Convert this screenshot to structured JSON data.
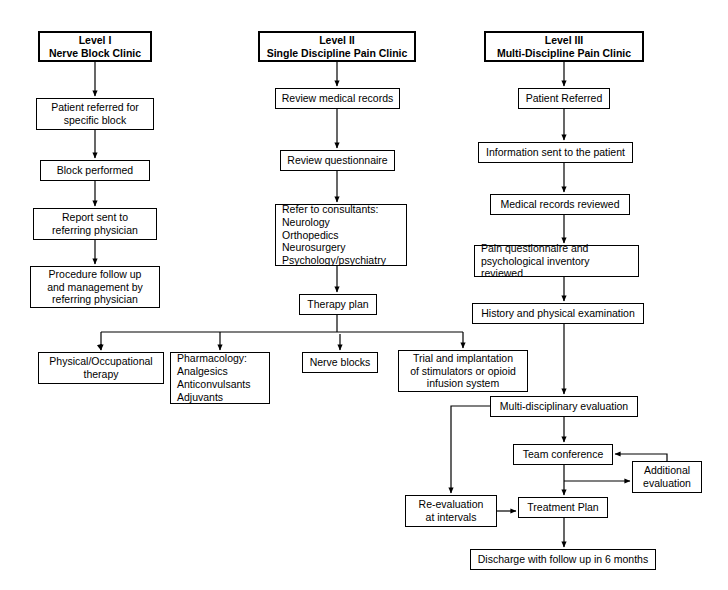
{
  "diagram": {
    "type": "flowchart",
    "background": "#ffffff",
    "line_color": "#000000",
    "text_color": "#000000"
  },
  "columns": [
    {
      "id": "level1",
      "header": "Level I\nNerve Block Clinic"
    },
    {
      "id": "level2",
      "header": "Level II\nSingle Discipline Pain Clinic"
    },
    {
      "id": "level3",
      "header": "Level III\nMulti-Discipline Pain Clinic"
    }
  ],
  "nodes": {
    "l1_header": {
      "text": "Level I\nNerve Block Clinic",
      "x": 38,
      "y": 31,
      "w": 114,
      "h": 31,
      "header": true
    },
    "l1_referred": {
      "text": "Patient referred for\nspecific block",
      "x": 36,
      "y": 98,
      "w": 118,
      "h": 32
    },
    "l1_block": {
      "text": "Block performed",
      "x": 40,
      "y": 160,
      "w": 110,
      "h": 21
    },
    "l1_report": {
      "text": "Report sent to\nreferring physician",
      "x": 33,
      "y": 208,
      "w": 124,
      "h": 32
    },
    "l1_followup": {
      "text": "Procedure follow up\nand management by\nreferring physician",
      "x": 30,
      "y": 266,
      "w": 130,
      "h": 42
    },
    "l2_header": {
      "text": "Level II\nSingle Discipline Pain Clinic",
      "x": 258,
      "y": 31,
      "w": 158,
      "h": 31,
      "header": true
    },
    "l2_records": {
      "text": "Review medical records",
      "x": 275,
      "y": 88,
      "w": 125,
      "h": 21
    },
    "l2_quest": {
      "text": "Review questionnaire",
      "x": 280,
      "y": 150,
      "w": 115,
      "h": 21
    },
    "l2_refer": {
      "text": "Refer to consultants:\n   Neurology\n   Orthopedics\n   Neurosurgery\n   Psychology/psychiatry",
      "x": 275,
      "y": 204,
      "w": 132,
      "h": 62,
      "leftalign": true
    },
    "l2_therapy": {
      "text": "Therapy plan",
      "x": 299,
      "y": 294,
      "w": 78,
      "h": 21
    },
    "b_physical": {
      "text": "Physical/Occupational\ntherapy",
      "x": 38,
      "y": 352,
      "w": 126,
      "h": 32
    },
    "b_pharma": {
      "text": "Pharmacology:\n   Analgesics\n   Anticonvulsants\n   Adjuvants",
      "x": 170,
      "y": 352,
      "w": 100,
      "h": 52,
      "leftalign": true
    },
    "b_nerve": {
      "text": "Nerve blocks",
      "x": 302,
      "y": 352,
      "w": 76,
      "h": 21
    },
    "b_trial": {
      "text": "Trial and implantation\nof stimulators or opioid\ninfusion system",
      "x": 398,
      "y": 350,
      "w": 130,
      "h": 42
    },
    "l3_header": {
      "text": "Level III\nMulti-Discipline Pain Clinic",
      "x": 484,
      "y": 31,
      "w": 160,
      "h": 31,
      "header": true
    },
    "l3_referred": {
      "text": "Patient Referred",
      "x": 518,
      "y": 88,
      "w": 92,
      "h": 21
    },
    "l3_info": {
      "text": "Information sent to the patient",
      "x": 478,
      "y": 142,
      "w": 155,
      "h": 21
    },
    "l3_records": {
      "text": "Medical records reviewed",
      "x": 490,
      "y": 194,
      "w": 140,
      "h": 21
    },
    "l3_painq": {
      "text": "Pain questionnaire and\npsychological inventory reviewed",
      "x": 474,
      "y": 245,
      "w": 165,
      "h": 32,
      "leftalign": true
    },
    "l3_history": {
      "text": "History and physical examination",
      "x": 472,
      "y": 303,
      "w": 172,
      "h": 21
    },
    "l3_multi": {
      "text": "Multi-disciplinary evaluation",
      "x": 490,
      "y": 396,
      "w": 148,
      "h": 21
    },
    "l3_team": {
      "text": "Team conference",
      "x": 513,
      "y": 444,
      "w": 100,
      "h": 21
    },
    "l3_addl": {
      "text": "Additional\nevaluation",
      "x": 632,
      "y": 461,
      "w": 70,
      "h": 32
    },
    "l3_reeval": {
      "text": "Re-evaluation\nat intervals",
      "x": 405,
      "y": 495,
      "w": 92,
      "h": 32
    },
    "l3_treat": {
      "text": "Treatment Plan",
      "x": 518,
      "y": 497,
      "w": 90,
      "h": 21
    },
    "l3_discharge": {
      "text": "Discharge with follow up in 6 months",
      "x": 470,
      "y": 549,
      "w": 186,
      "h": 21
    }
  },
  "edges": [
    {
      "from": "l1_header",
      "to": "l1_referred",
      "label": ""
    },
    {
      "from": "l1_referred",
      "to": "l1_block",
      "label": ""
    },
    {
      "from": "l1_block",
      "to": "l1_report",
      "label": ""
    },
    {
      "from": "l1_report",
      "to": "l1_followup",
      "label": ""
    },
    {
      "from": "l2_header",
      "to": "l2_records",
      "label": ""
    },
    {
      "from": "l2_records",
      "to": "l2_quest",
      "label": ""
    },
    {
      "from": "l2_quest",
      "to": "l2_refer",
      "label": ""
    },
    {
      "from": "l2_refer",
      "to": "l2_therapy",
      "label": ""
    },
    {
      "from": "l2_therapy",
      "to": "b_physical",
      "label": ""
    },
    {
      "from": "l2_therapy",
      "to": "b_pharma",
      "label": ""
    },
    {
      "from": "l2_therapy",
      "to": "b_nerve",
      "label": ""
    },
    {
      "from": "l2_therapy",
      "to": "b_trial",
      "label": ""
    },
    {
      "from": "l3_header",
      "to": "l3_referred",
      "label": ""
    },
    {
      "from": "l3_referred",
      "to": "l3_info",
      "label": ""
    },
    {
      "from": "l3_info",
      "to": "l3_records",
      "label": ""
    },
    {
      "from": "l3_records",
      "to": "l3_painq",
      "label": ""
    },
    {
      "from": "l3_painq",
      "to": "l3_history",
      "label": ""
    },
    {
      "from": "l3_history",
      "to": "l3_multi",
      "label": ""
    },
    {
      "from": "l3_multi",
      "to": "l3_team",
      "label": ""
    },
    {
      "from": "l3_multi",
      "to": "l3_reeval",
      "label": ""
    },
    {
      "from": "l3_team",
      "to": "l3_treat",
      "label": ""
    },
    {
      "from": "l3_team",
      "to": "l3_addl",
      "label": ""
    },
    {
      "from": "l3_addl",
      "to": "l3_team",
      "label": ""
    },
    {
      "from": "l3_reeval",
      "to": "l3_treat",
      "label": ""
    },
    {
      "from": "l3_treat",
      "to": "l3_discharge",
      "label": ""
    }
  ]
}
